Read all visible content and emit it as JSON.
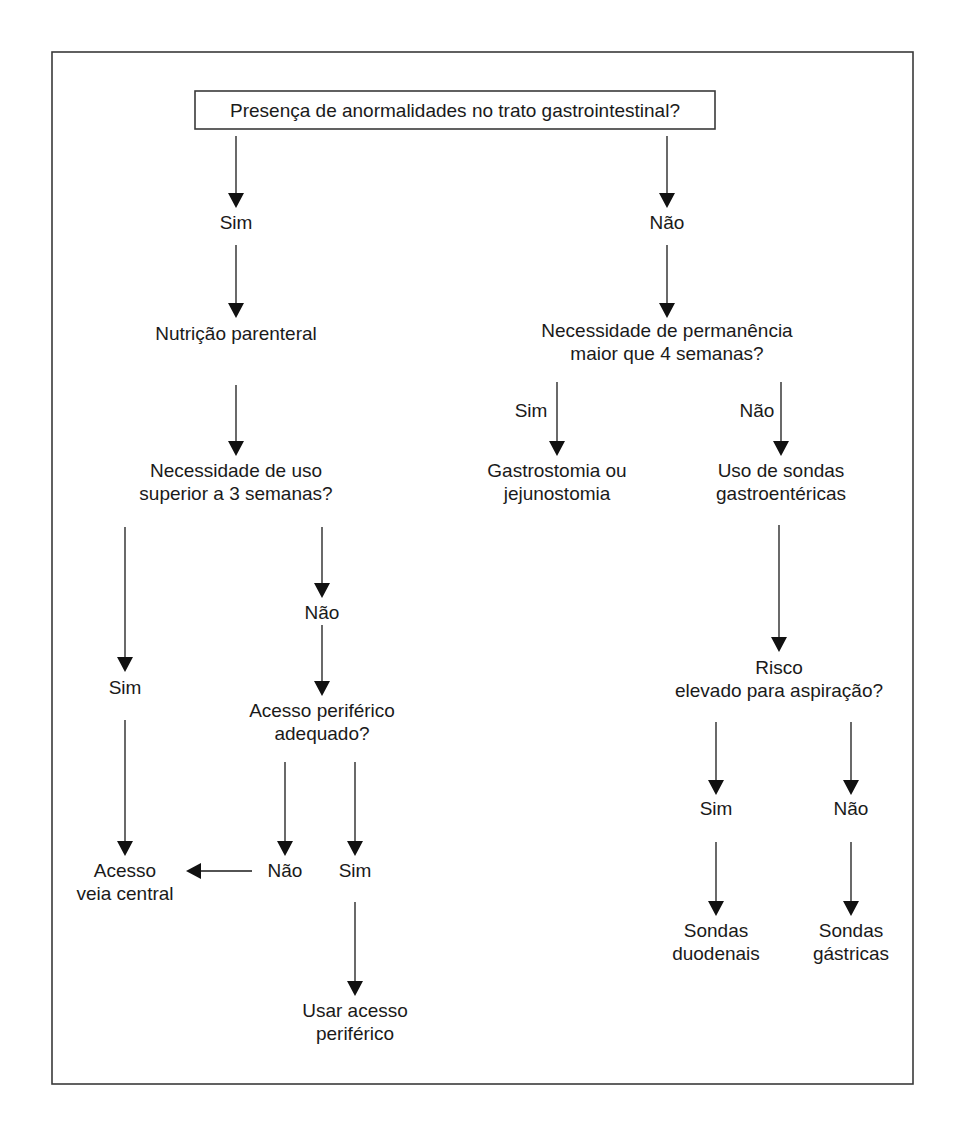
{
  "diagram": {
    "type": "flowchart",
    "root": {
      "id": "q_gi",
      "text": "Presença de anormalidades no trato gastrointestinal?"
    },
    "nodes": [
      {
        "id": "sim_gi",
        "lines": [
          "Sim"
        ],
        "kind": "answer"
      },
      {
        "id": "nao_gi",
        "lines": [
          "Não"
        ],
        "kind": "answer"
      },
      {
        "id": "np",
        "lines": [
          "Nutrição parenteral"
        ],
        "kind": "step"
      },
      {
        "id": "q_3sem",
        "lines": [
          "Necessidade de uso",
          "superior a 3 semanas?"
        ],
        "kind": "question"
      },
      {
        "id": "sim_3sem",
        "lines": [
          "Sim"
        ],
        "kind": "answer"
      },
      {
        "id": "nao_3sem",
        "lines": [
          "Não"
        ],
        "kind": "answer"
      },
      {
        "id": "q_periferico",
        "lines": [
          "Acesso periférico",
          "adequado?"
        ],
        "kind": "question"
      },
      {
        "id": "nao_periferico",
        "lines": [
          "Não"
        ],
        "kind": "answer"
      },
      {
        "id": "sim_periferico",
        "lines": [
          "Sim"
        ],
        "kind": "answer"
      },
      {
        "id": "veia_central",
        "lines": [
          "Acesso",
          "veia central"
        ],
        "kind": "outcome"
      },
      {
        "id": "usar_periferico",
        "lines": [
          "Usar acesso",
          "periférico"
        ],
        "kind": "outcome"
      },
      {
        "id": "q_4sem",
        "lines": [
          "Necessidade de permanência",
          "maior que 4 semanas?"
        ],
        "kind": "question"
      },
      {
        "id": "sim_4sem",
        "lines": [
          "Sim"
        ],
        "kind": "edge-label"
      },
      {
        "id": "nao_4sem",
        "lines": [
          "Não"
        ],
        "kind": "edge-label"
      },
      {
        "id": "gastrostomia",
        "lines": [
          "Gastrostomia ou",
          "jejunostomia"
        ],
        "kind": "outcome"
      },
      {
        "id": "sondas_ge",
        "lines": [
          "Uso de sondas",
          "gastroentéricas"
        ],
        "kind": "step"
      },
      {
        "id": "q_aspiracao",
        "lines": [
          "Risco",
          "elevado para aspiração?"
        ],
        "kind": "question"
      },
      {
        "id": "sim_aspiracao",
        "lines": [
          "Sim"
        ],
        "kind": "answer"
      },
      {
        "id": "nao_aspiracao",
        "lines": [
          "Não"
        ],
        "kind": "answer"
      },
      {
        "id": "duodenais",
        "lines": [
          "Sondas",
          "duodenais"
        ],
        "kind": "outcome"
      },
      {
        "id": "gastricas",
        "lines": [
          "Sondas",
          "gástricas"
        ],
        "kind": "outcome"
      }
    ],
    "edges": [
      {
        "from": "q_gi",
        "to": "sim_gi"
      },
      {
        "from": "q_gi",
        "to": "nao_gi"
      },
      {
        "from": "sim_gi",
        "to": "np"
      },
      {
        "from": "np",
        "to": "q_3sem"
      },
      {
        "from": "q_3sem",
        "to": "sim_3sem"
      },
      {
        "from": "q_3sem",
        "to": "nao_3sem"
      },
      {
        "from": "nao_3sem",
        "to": "q_periferico"
      },
      {
        "from": "sim_3sem",
        "to": "veia_central"
      },
      {
        "from": "q_periferico",
        "to": "nao_periferico"
      },
      {
        "from": "q_periferico",
        "to": "sim_periferico"
      },
      {
        "from": "nao_periferico",
        "to": "veia_central"
      },
      {
        "from": "sim_periferico",
        "to": "usar_periferico"
      },
      {
        "from": "nao_gi",
        "to": "q_4sem"
      },
      {
        "from": "q_4sem",
        "to": "gastrostomia",
        "label": "Sim"
      },
      {
        "from": "q_4sem",
        "to": "sondas_ge",
        "label": "Não"
      },
      {
        "from": "sondas_ge",
        "to": "q_aspiracao"
      },
      {
        "from": "q_aspiracao",
        "to": "sim_aspiracao"
      },
      {
        "from": "q_aspiracao",
        "to": "nao_aspiracao"
      },
      {
        "from": "sim_aspiracao",
        "to": "duodenais"
      },
      {
        "from": "nao_aspiracao",
        "to": "gastricas"
      }
    ]
  }
}
